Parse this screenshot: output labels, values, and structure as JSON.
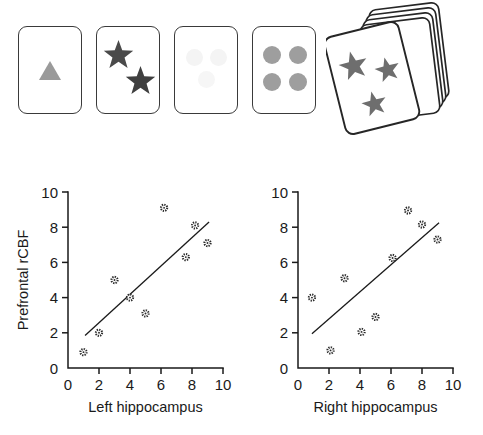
{
  "figure": {
    "stimulus": {
      "name": "card-stimulus-row",
      "cards": [
        {
          "id": "card-triangle",
          "label": "card with single gray triangle",
          "shapes": [
            {
              "kind": "triangle",
              "x": 20,
              "y": 34,
              "size": 22,
              "color": "#9a9a9a"
            }
          ]
        },
        {
          "id": "card-two-stars",
          "label": "card with two dark stars",
          "shapes": [
            {
              "kind": "star",
              "x": 6,
              "y": 13,
              "size": 31,
              "color": "#4a4a4a"
            },
            {
              "kind": "star",
              "x": 28,
              "y": 39,
              "size": 31,
              "color": "#3f3f3f"
            }
          ]
        },
        {
          "id": "card-faint-shapes",
          "label": "card with three very faint circles",
          "shapes": [
            {
              "kind": "circle",
              "x": 11,
              "y": 22,
              "size": 17,
              "color": "#f4f4f4"
            },
            {
              "kind": "circle",
              "x": 35,
              "y": 22,
              "size": 17,
              "color": "#f4f4f4"
            },
            {
              "kind": "circle",
              "x": 23,
              "y": 44,
              "size": 17,
              "color": "#f6f6f6"
            }
          ]
        },
        {
          "id": "card-four-circles",
          "label": "card with four gray circles",
          "shapes": [
            {
              "kind": "circle",
              "x": 10,
              "y": 19,
              "size": 18,
              "color": "#9e9e9e"
            },
            {
              "kind": "circle",
              "x": 36,
              "y": 19,
              "size": 18,
              "color": "#9e9e9e"
            },
            {
              "kind": "circle",
              "x": 10,
              "y": 46,
              "size": 18,
              "color": "#9e9e9e"
            },
            {
              "kind": "circle",
              "x": 36,
              "y": 46,
              "size": 18,
              "color": "#9e9e9e"
            }
          ]
        }
      ],
      "deck": {
        "id": "card-deck",
        "label": "tilted deck of cards, front card shows three gray stars",
        "star_count": 3,
        "back_card_count": 4,
        "star_color": "#6e6e6e",
        "outline_color": "#262626"
      }
    },
    "colors": {
      "ink": "#1a1a1a",
      "card_outline": "#3a3a3a",
      "star_dark": "#4a4a4a",
      "triangle_gray": "#9a9a9a",
      "circle_gray": "#9e9e9e",
      "faint_gray": "#f4f4f4",
      "deck_star_gray": "#6e6e6e"
    }
  },
  "chart_data": [
    {
      "id": "left-hippocampus-scatter",
      "type": "scatter",
      "title": "",
      "xlabel": "Left hippocampus",
      "ylabel": "Prefrontal rCBF",
      "xlim": [
        0,
        10
      ],
      "ylim": [
        0,
        10
      ],
      "xticks": [
        0,
        2,
        4,
        6,
        8,
        10
      ],
      "yticks": [
        0,
        2,
        4,
        6,
        8,
        10
      ],
      "grid": false,
      "legend": "none",
      "points": [
        {
          "x": 1.0,
          "y": 0.9
        },
        {
          "x": 2.0,
          "y": 2.0
        },
        {
          "x": 3.0,
          "y": 5.0
        },
        {
          "x": 4.0,
          "y": 4.0
        },
        {
          "x": 5.0,
          "y": 3.1
        },
        {
          "x": 6.2,
          "y": 9.1
        },
        {
          "x": 7.6,
          "y": 6.3
        },
        {
          "x": 8.2,
          "y": 8.1
        },
        {
          "x": 9.0,
          "y": 7.1
        }
      ],
      "fit_line": {
        "x0": 1.1,
        "y0": 1.85,
        "x1": 9.1,
        "y1": 8.3
      }
    },
    {
      "id": "right-hippocampus-scatter",
      "type": "scatter",
      "title": "",
      "xlabel": "Right hippocampus",
      "ylabel": "Prefrontal rCBF",
      "xlim": [
        0,
        10
      ],
      "ylim": [
        0,
        10
      ],
      "xticks": [
        0,
        2,
        4,
        6,
        8,
        10
      ],
      "yticks": [
        0,
        2,
        4,
        6,
        8,
        10
      ],
      "grid": false,
      "legend": "none",
      "points": [
        {
          "x": 0.9,
          "y": 4.0
        },
        {
          "x": 2.1,
          "y": 1.0
        },
        {
          "x": 3.0,
          "y": 5.1
        },
        {
          "x": 4.1,
          "y": 2.05
        },
        {
          "x": 5.0,
          "y": 2.9
        },
        {
          "x": 6.1,
          "y": 6.25
        },
        {
          "x": 7.1,
          "y": 8.95
        },
        {
          "x": 8.0,
          "y": 8.15
        },
        {
          "x": 9.0,
          "y": 7.3
        }
      ],
      "fit_line": {
        "x0": 0.9,
        "y0": 1.95,
        "x1": 9.1,
        "y1": 8.25
      }
    }
  ]
}
